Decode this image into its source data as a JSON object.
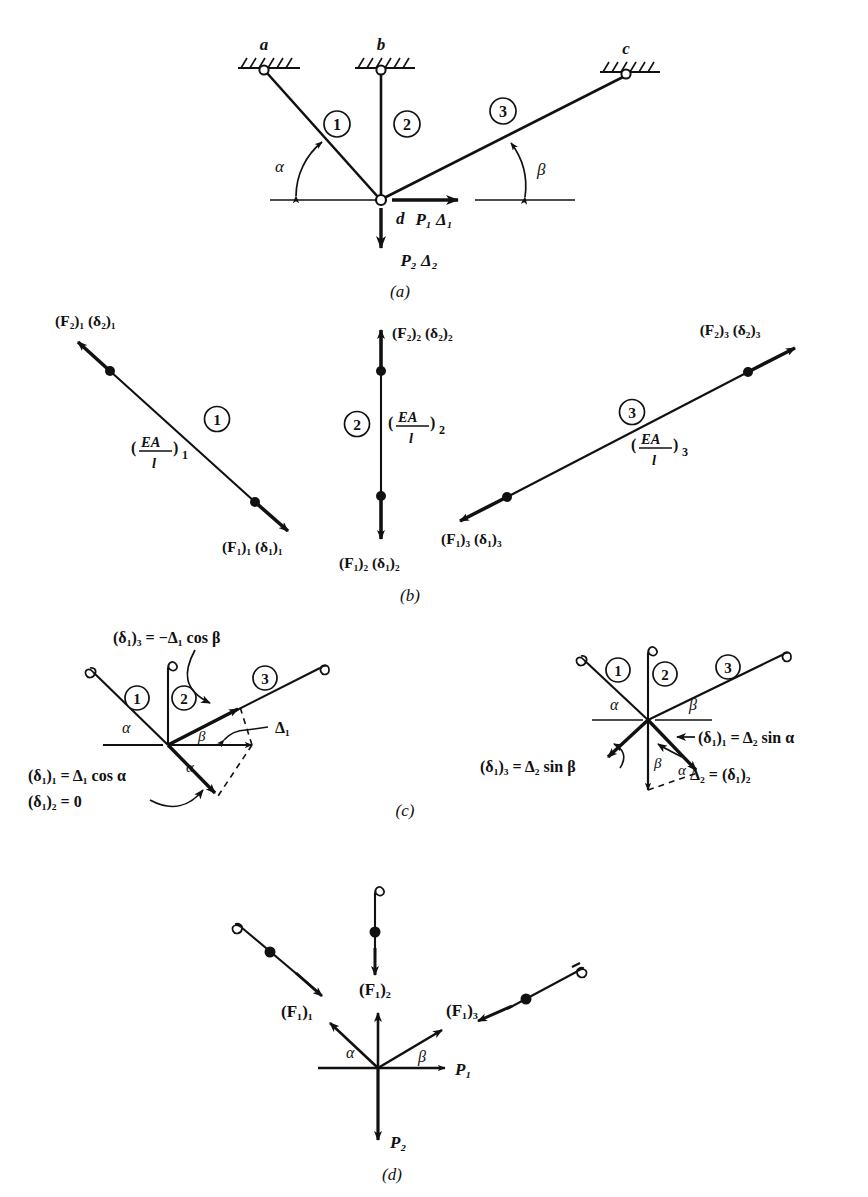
{
  "figure": {
    "background_color": "#ffffff",
    "ink_color": "#111111",
    "panel_labels": {
      "a": "(a)",
      "b": "(b)",
      "c": "(c)",
      "d": "(d)"
    }
  },
  "panel_a": {
    "caption": "(a)",
    "supports": [
      {
        "name": "a",
        "label": "a"
      },
      {
        "name": "b",
        "label": "b"
      },
      {
        "name": "c",
        "label": "c"
      }
    ],
    "joint_label": "d",
    "members": [
      {
        "number": "1"
      },
      {
        "number": "2"
      },
      {
        "number": "3"
      }
    ],
    "angles": [
      {
        "symbol": "α"
      },
      {
        "symbol": "β"
      }
    ],
    "loads": [
      {
        "label": "P₁ Δ₁",
        "direction": "right"
      },
      {
        "label": "P₂ Δ₂",
        "direction": "down"
      }
    ]
  },
  "panel_b": {
    "caption": "(b)",
    "elements": [
      {
        "number": "1",
        "stiffness": "(EA/l)₁",
        "stiffness_numerator": "EA",
        "stiffness_denominator": "l",
        "stiffness_subscript": "1",
        "end_2_label": "(F₂)₁ (δ₂)₁",
        "end_1_label": "(F₁)₁ (δ₁)₁"
      },
      {
        "number": "2",
        "stiffness": "(EA/l)₂",
        "stiffness_numerator": "EA",
        "stiffness_denominator": "l",
        "stiffness_subscript": "2",
        "end_2_label": "(F₂)₂ (δ₂)₂",
        "end_1_label": "(F₁)₂ (δ₁)₂"
      },
      {
        "number": "3",
        "stiffness": "(EA/l)₃",
        "stiffness_numerator": "EA",
        "stiffness_denominator": "l",
        "stiffness_subscript": "3",
        "end_2_label": "(F₂)₃ (δ₂)₃",
        "end_1_label": "(F₁)₃ (δ₁)₃"
      }
    ]
  },
  "panel_c": {
    "caption": "(c)",
    "left": {
      "members": [
        "1",
        "2",
        "3"
      ],
      "angles": [
        "α",
        "β",
        "α"
      ],
      "displacement_label": "Δ₁",
      "equations": [
        "(δ₁)₃ = −Δ₁ cos β",
        "(δ₁)₁ = Δ₁ cos α",
        "(δ₁)₂ = 0"
      ]
    },
    "right": {
      "members": [
        "1",
        "2",
        "3"
      ],
      "angles": [
        "α",
        "β",
        "β",
        "α"
      ],
      "displacement_label": "Δ₂ = (δ₁)₂",
      "equations": [
        "(δ₁)₁ = Δ₂ sin α",
        "(δ₁)₃ = Δ₂ sin β"
      ]
    }
  },
  "panel_d": {
    "caption": "(d)",
    "forces": [
      {
        "label": "(F₁)₁"
      },
      {
        "label": "(F₁)₂"
      },
      {
        "label": "(F₁)₃"
      }
    ],
    "angles": [
      "α",
      "β"
    ],
    "loads": [
      {
        "label": "P₁",
        "direction": "right"
      },
      {
        "label": "P₂",
        "direction": "down"
      }
    ]
  }
}
